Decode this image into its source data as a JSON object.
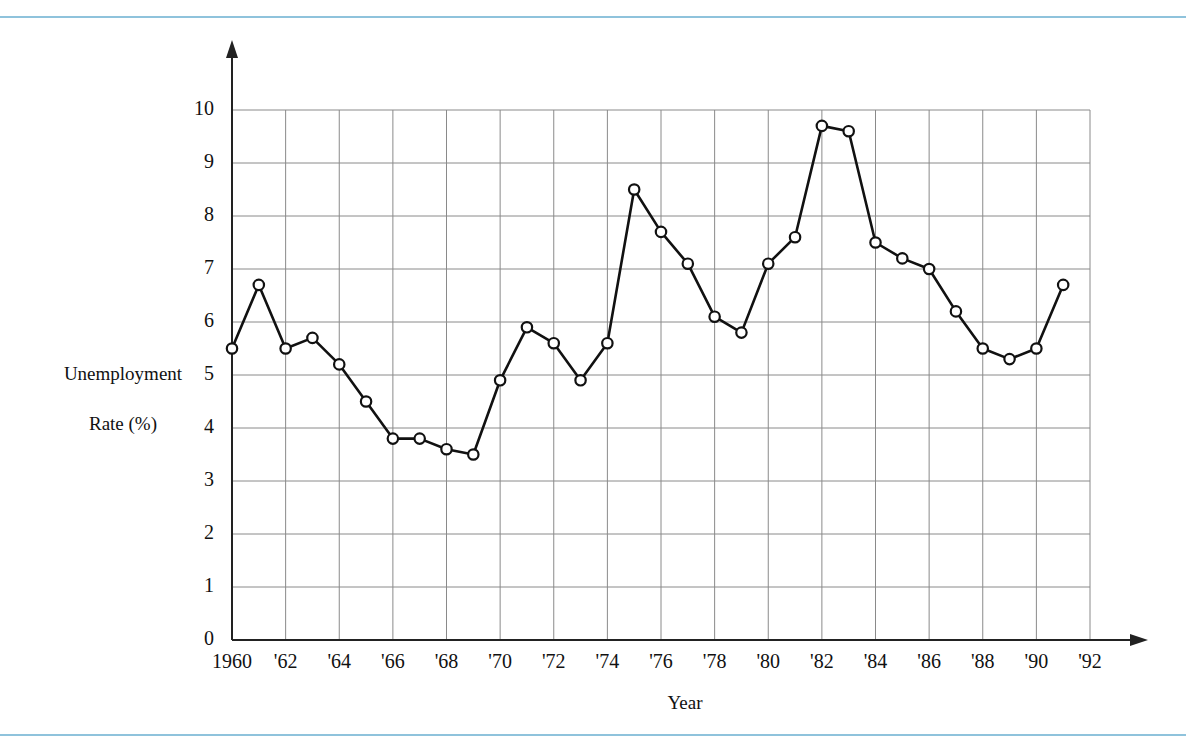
{
  "figure": {
    "background_color": "#ffffff",
    "rule_color": "#8fc3dc",
    "line_color": "#111111",
    "grid_color": "#8a8a8a",
    "marker_fill": "#ffffff"
  },
  "chart_data": {
    "type": "line",
    "title": "",
    "xlabel": "Year",
    "ylabel": "Unemployment\nRate (%)",
    "ylabel_line1": "Unemployment",
    "ylabel_line2": "Rate (%)",
    "xlim": [
      1959,
      1993
    ],
    "ylim": [
      0,
      10
    ],
    "grid": true,
    "legend": "none",
    "markers": "open-circle",
    "ytick_labels": [
      "0",
      "1",
      "2",
      "3",
      "4",
      "5",
      "6",
      "7",
      "8",
      "9",
      "10"
    ],
    "ytick_values": [
      0,
      1,
      2,
      3,
      4,
      5,
      6,
      7,
      8,
      9,
      10
    ],
    "xtick_labels": [
      "1960",
      "'62",
      "'64",
      "'66",
      "'68",
      "'70",
      "'72",
      "'74",
      "'76",
      "'78",
      "'80",
      "'82",
      "'84",
      "'86",
      "'88",
      "'90",
      "'92"
    ],
    "xtick_values": [
      1960,
      1962,
      1964,
      1966,
      1968,
      1970,
      1972,
      1974,
      1976,
      1978,
      1980,
      1982,
      1984,
      1986,
      1988,
      1990,
      1992
    ],
    "x": [
      1960,
      1961,
      1962,
      1963,
      1964,
      1965,
      1966,
      1967,
      1968,
      1969,
      1970,
      1971,
      1972,
      1973,
      1974,
      1975,
      1976,
      1977,
      1978,
      1979,
      1980,
      1981,
      1982,
      1983,
      1984,
      1985,
      1986,
      1987,
      1988,
      1989,
      1990,
      1991
    ],
    "values": [
      5.5,
      6.7,
      5.5,
      5.7,
      5.2,
      4.5,
      3.8,
      3.8,
      3.6,
      3.5,
      4.9,
      5.9,
      5.6,
      4.9,
      5.6,
      8.5,
      7.7,
      7.1,
      6.1,
      5.8,
      7.1,
      7.6,
      9.7,
      9.6,
      7.5,
      7.2,
      7.0,
      6.2,
      5.5,
      5.3,
      5.5,
      6.7
    ],
    "series": [
      {
        "name": "Unemployment Rate (%)",
        "points": [
          {
            "year": 1960,
            "rate": 5.5
          },
          {
            "year": 1961,
            "rate": 6.7
          },
          {
            "year": 1962,
            "rate": 5.5
          },
          {
            "year": 1963,
            "rate": 5.7
          },
          {
            "year": 1964,
            "rate": 5.2
          },
          {
            "year": 1965,
            "rate": 4.5
          },
          {
            "year": 1966,
            "rate": 3.8
          },
          {
            "year": 1967,
            "rate": 3.8
          },
          {
            "year": 1968,
            "rate": 3.6
          },
          {
            "year": 1969,
            "rate": 3.5
          },
          {
            "year": 1970,
            "rate": 4.9
          },
          {
            "year": 1971,
            "rate": 5.9
          },
          {
            "year": 1972,
            "rate": 5.6
          },
          {
            "year": 1973,
            "rate": 4.9
          },
          {
            "year": 1974,
            "rate": 5.6
          },
          {
            "year": 1975,
            "rate": 8.5
          },
          {
            "year": 1976,
            "rate": 7.7
          },
          {
            "year": 1977,
            "rate": 7.1
          },
          {
            "year": 1978,
            "rate": 6.1
          },
          {
            "year": 1979,
            "rate": 5.8
          },
          {
            "year": 1980,
            "rate": 7.1
          },
          {
            "year": 1981,
            "rate": 7.6
          },
          {
            "year": 1982,
            "rate": 9.7
          },
          {
            "year": 1983,
            "rate": 9.6
          },
          {
            "year": 1984,
            "rate": 7.5
          },
          {
            "year": 1985,
            "rate": 7.2
          },
          {
            "year": 1986,
            "rate": 7.0
          },
          {
            "year": 1987,
            "rate": 6.2
          },
          {
            "year": 1988,
            "rate": 5.5
          },
          {
            "year": 1989,
            "rate": 5.3
          },
          {
            "year": 1990,
            "rate": 5.5
          },
          {
            "year": 1991,
            "rate": 6.7
          }
        ]
      }
    ]
  }
}
